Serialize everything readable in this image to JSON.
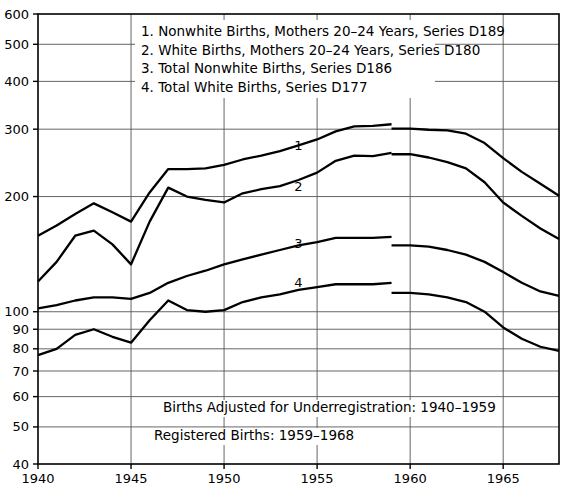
{
  "chart_data": {
    "type": "line",
    "title": "",
    "xlabel": "",
    "ylabel": "",
    "yscale": "log",
    "ylim": [
      40,
      600
    ],
    "xlim": [
      1940,
      1968
    ],
    "grid": true,
    "legend_position": "top-center",
    "ytick_labels": [
      "600",
      "500",
      "400",
      "300",
      "200",
      "100",
      "90",
      "80",
      "70",
      "60",
      "50",
      "40"
    ],
    "ytick_values": [
      600,
      500,
      400,
      300,
      200,
      100,
      90,
      80,
      70,
      60,
      50,
      40
    ],
    "xtick_labels": [
      "1940",
      "1945",
      "1950",
      "1955",
      "1960",
      "1965"
    ],
    "xtick_values": [
      1940,
      1945,
      1950,
      1955,
      1960,
      1965
    ],
    "annotations": [
      "Births Adjusted for Underregistration: 1940–1959",
      "Registered Births: 1959–1968"
    ],
    "legend_entries": [
      "1.  Nonwhite Births, Mothers 20–24 Years, Series D189",
      "2.  White Births, Mothers 20–24 Years, Series D180",
      "3.  Total Nonwhite Births, Series D186",
      "4.  Total White Births, Series D177"
    ],
    "series": [
      {
        "name": "Nonwhite Births, Mothers 20-24 Years, Series D189",
        "series_code": "D189",
        "tag": "1",
        "tag_x": 1954,
        "tag_y": 272,
        "segments": [
          {
            "label": "adjusted",
            "x": [
              1940,
              1941,
              1942,
              1943,
              1944,
              1945,
              1946,
              1947,
              1948,
              1949,
              1950,
              1951,
              1952,
              1953,
              1954,
              1955,
              1956,
              1957,
              1958,
              1959
            ],
            "y": [
              158,
              168,
              180,
              192,
              182,
              172,
              205,
              236,
              236,
              237,
              242,
              250,
              256,
              263,
              272,
              282,
              296,
              305,
              306,
              309
            ]
          },
          {
            "label": "registered",
            "x": [
              1959,
              1960,
              1961,
              1962,
              1963,
              1964,
              1965,
              1966,
              1967,
              1968
            ],
            "y": [
              301,
              301,
              299,
              298,
              292,
              276,
              252,
              232,
              216,
              201
            ]
          }
        ]
      },
      {
        "name": "White Births, Mothers 20-24 Years, Series D180",
        "series_code": "D180",
        "tag": "2",
        "tag_x": 1954,
        "tag_y": 213,
        "segments": [
          {
            "label": "adjusted",
            "x": [
              1940,
              1941,
              1942,
              1943,
              1944,
              1945,
              1946,
              1947,
              1948,
              1949,
              1950,
              1951,
              1952,
              1953,
              1954,
              1955,
              1956,
              1957,
              1958,
              1959
            ],
            "y": [
              120,
              135,
              158,
              163,
              150,
              133,
              172,
              211,
              200,
              196,
              193,
              204,
              209,
              213,
              221,
              231,
              248,
              256,
              255,
              260
            ]
          },
          {
            "label": "registered",
            "x": [
              1959,
              1960,
              1961,
              1962,
              1963,
              1964,
              1965,
              1966,
              1967,
              1968
            ],
            "y": [
              258,
              258,
              253,
              246,
              237,
              218,
              193,
              178,
              165,
              155
            ]
          }
        ]
      },
      {
        "name": "Total Nonwhite Births, Series D186",
        "series_code": "D186",
        "tag": "3",
        "tag_x": 1954,
        "tag_y": 151,
        "segments": [
          {
            "label": "adjusted",
            "x": [
              1940,
              1941,
              1942,
              1943,
              1944,
              1945,
              1946,
              1947,
              1948,
              1949,
              1950,
              1951,
              1952,
              1953,
              1954,
              1955,
              1956,
              1957,
              1958,
              1959
            ],
            "y": [
              102,
              104,
              107,
              109,
              109,
              108,
              112,
              119,
              124,
              128,
              133,
              137,
              141,
              145,
              149,
              152,
              156,
              156,
              156,
              157
            ]
          },
          {
            "label": "registered",
            "x": [
              1959,
              1960,
              1961,
              1962,
              1963,
              1964,
              1965,
              1966,
              1967,
              1968
            ],
            "y": [
              149,
              149,
              148,
              145,
              141,
              135,
              127,
              119,
              113,
              110
            ]
          }
        ]
      },
      {
        "name": "Total White Births, Series D177",
        "series_code": "D177",
        "tag": "4",
        "tag_x": 1954,
        "tag_y": 119,
        "segments": [
          {
            "label": "adjusted",
            "x": [
              1940,
              1941,
              1942,
              1943,
              1944,
              1945,
              1946,
              1947,
              1948,
              1949,
              1950,
              1951,
              1952,
              1953,
              1954,
              1955,
              1956,
              1957,
              1958,
              1959
            ],
            "y": [
              77,
              80,
              87,
              90,
              86,
              83,
              95,
              107,
              101,
              100,
              101,
              106,
              109,
              111,
              114,
              116,
              118,
              118,
              118,
              119
            ]
          },
          {
            "label": "registered",
            "x": [
              1959,
              1960,
              1961,
              1962,
              1963,
              1964,
              1965,
              1966,
              1967,
              1968
            ],
            "y": [
              112,
              112,
              111,
              109,
              106,
              100,
              91,
              85,
              81,
              79
            ]
          }
        ]
      }
    ]
  }
}
